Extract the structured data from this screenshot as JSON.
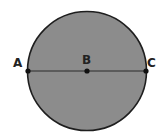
{
  "diagram": {
    "shape": "circle",
    "fill_color": "#8c8c8c",
    "stroke_color": "#1e1e1e",
    "line_color": "#2a2a2a",
    "points": [
      {
        "id": "A",
        "label": "A",
        "role": "endpoint on circle (left)"
      },
      {
        "id": "B",
        "label": "B",
        "role": "center of circle"
      },
      {
        "id": "C",
        "label": "C",
        "role": "endpoint on circle (right)"
      }
    ],
    "segment": "AC (diameter through B)"
  }
}
